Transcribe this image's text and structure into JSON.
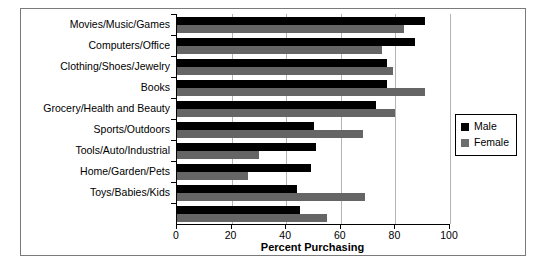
{
  "chart_data": {
    "type": "bar",
    "orientation": "horizontal",
    "title": "",
    "xlabel": "Percent Purchasing",
    "ylabel": "",
    "xlim": [
      0,
      100
    ],
    "xticks": [
      0,
      20,
      40,
      60,
      80,
      100
    ],
    "grid": true,
    "legend_position": "right",
    "categories": [
      "Movies/Music/Games",
      "Computers/Office",
      "Clothing/Shoes/Jewelry",
      "Books",
      "Grocery/Health and Beauty",
      "Sports/Outdoors",
      "Tools/Auto/Industrial",
      "Home/Garden/Pets",
      "Toys/Babies/Kids",
      ""
    ],
    "series": [
      {
        "name": "Male",
        "color": "#000000",
        "values": [
          91,
          87,
          77,
          77,
          73,
          50,
          51,
          49,
          44,
          45
        ]
      },
      {
        "name": "Female",
        "color": "#656565",
        "values": [
          83,
          75,
          79,
          91,
          80,
          68,
          30,
          26,
          69,
          55
        ]
      }
    ]
  },
  "legend": {
    "items": [
      {
        "label": "Male",
        "swatch": "male"
      },
      {
        "label": "Female",
        "swatch": "female"
      }
    ]
  },
  "axis": {
    "x_title": "Percent Purchasing",
    "tick_labels": [
      "0",
      "20",
      "40",
      "60",
      "80",
      "100"
    ]
  }
}
